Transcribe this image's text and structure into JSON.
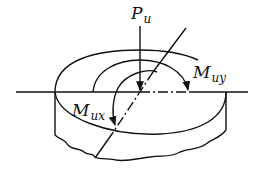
{
  "diagram": {
    "type": "mechanics-schematic",
    "labels": {
      "force": {
        "main": "P",
        "sub": "u"
      },
      "moment_y": {
        "main": "M",
        "sub": "uy"
      },
      "moment_x": {
        "main": "M",
        "sub": "ux"
      }
    },
    "colors": {
      "stroke": "#111111",
      "background": "#ffffff"
    }
  }
}
